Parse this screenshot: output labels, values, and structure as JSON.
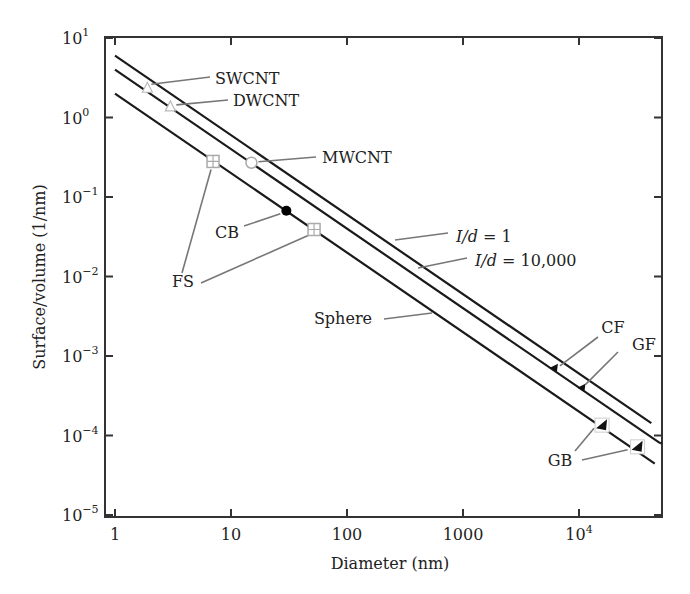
{
  "chart_data": {
    "type": "line",
    "title": "",
    "xlabel": "Diameter (nm)",
    "ylabel": "Surface/volume (1/nm)",
    "xscale": "log",
    "yscale": "log",
    "xlim": [
      0.8,
      60000
    ],
    "ylim": [
      1e-05,
      10
    ],
    "grid": false,
    "x_ticks": [
      {
        "value": 1,
        "label": "1",
        "sup": ""
      },
      {
        "value": 10,
        "label": "10",
        "sup": ""
      },
      {
        "value": 100,
        "label": "100",
        "sup": ""
      },
      {
        "value": 1000,
        "label": "1000",
        "sup": ""
      },
      {
        "value": 10000,
        "label": "10",
        "sup": "4"
      }
    ],
    "y_ticks": [
      {
        "value": 10,
        "label": "10",
        "sup": "1"
      },
      {
        "value": 1,
        "label": "10",
        "sup": "0"
      },
      {
        "value": 0.1,
        "label": "10",
        "sup": "−1"
      },
      {
        "value": 0.01,
        "label": "10",
        "sup": "−2"
      },
      {
        "value": 0.001,
        "label": "10",
        "sup": "−3"
      },
      {
        "value": 0.0001,
        "label": "10",
        "sup": "−4"
      },
      {
        "value": 1e-05,
        "label": "10",
        "sup": "−5"
      }
    ],
    "series": [
      {
        "name": "l/d = 1",
        "label": "I/d = 1",
        "x": [
          1,
          42000
        ],
        "y": [
          6,
          0.000143
        ]
      },
      {
        "name": "l/d = 10,000",
        "label": "I/d = 10,000",
        "x": [
          1,
          50000
        ],
        "y": [
          4,
          8e-05
        ]
      },
      {
        "name": "Sphere",
        "label": "Sphere",
        "x": [
          1,
          45000
        ],
        "y": [
          2,
          4.44e-05
        ]
      }
    ],
    "points": [
      {
        "name": "SWCNT",
        "x": 1.9,
        "y": 2.4,
        "marker": "triangle-open"
      },
      {
        "name": "DWCNT",
        "x": 3.0,
        "y": 1.4,
        "marker": "triangle-open"
      },
      {
        "name": "MWCNT",
        "x": 15,
        "y": 0.27,
        "marker": "circle-open"
      },
      {
        "name": "FS",
        "x": 7,
        "y": 0.28,
        "marker": "square-cross"
      },
      {
        "name": "CB",
        "x": 30,
        "y": 0.067,
        "marker": "circle-filled"
      },
      {
        "name": "FS",
        "x": 52,
        "y": 0.039,
        "marker": "square-cross"
      },
      {
        "name": "CF",
        "x": 6200,
        "y": 0.00071,
        "marker": "triangle-filled"
      },
      {
        "name": "GF",
        "x": 10700,
        "y": 0.0004,
        "marker": "triangle-filled"
      },
      {
        "name": "GB",
        "x": 15800,
        "y": 0.000135,
        "marker": "triangle-filled-box"
      },
      {
        "name": "GB",
        "x": 32000,
        "y": 7.2e-05,
        "marker": "triangle-filled-box"
      }
    ],
    "annotations": [
      {
        "text": "SWCNT",
        "points_to": [
          0
        ]
      },
      {
        "text": "DWCNT",
        "points_to": [
          1
        ]
      },
      {
        "text": "MWCNT",
        "points_to": [
          2
        ]
      },
      {
        "text": "CB",
        "points_to": [
          4
        ]
      },
      {
        "text": "FS",
        "points_to": [
          3,
          5
        ]
      },
      {
        "text": "I/d = 1",
        "points_to_series": 0
      },
      {
        "text": "I/d = 10,000",
        "points_to_series": 1
      },
      {
        "text": "Sphere",
        "points_to_series": 2
      },
      {
        "text": "CF",
        "points_to": [
          6
        ]
      },
      {
        "text": "GF",
        "points_to": [
          7
        ]
      },
      {
        "text": "GB",
        "points_to": [
          8,
          9
        ]
      }
    ],
    "legend": "none"
  }
}
